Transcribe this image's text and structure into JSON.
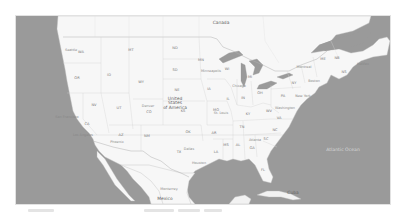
{
  "map": {
    "region": "North America",
    "style": "grayscale",
    "colors": {
      "water": "#9a9a9a",
      "land": "#f7f7f7",
      "border": "#bdbdbd",
      "state_border": "#cfcfcf",
      "frame_border": "#e2e2e2"
    },
    "countries": [
      {
        "id": "usa",
        "label": "United\nStates\nof America"
      },
      {
        "id": "canada",
        "label": "Canada"
      },
      {
        "id": "mexico",
        "label": "Mexico"
      },
      {
        "id": "cuba",
        "label": "Cuba"
      }
    ],
    "states": [
      {
        "abbr": "WA",
        "x": 80,
        "y": 52
      },
      {
        "abbr": "OR",
        "x": 76,
        "y": 78
      },
      {
        "abbr": "ID",
        "x": 108,
        "y": 75
      },
      {
        "abbr": "MT",
        "x": 130,
        "y": 50
      },
      {
        "abbr": "WY",
        "x": 140,
        "y": 82
      },
      {
        "abbr": "NV",
        "x": 93,
        "y": 105
      },
      {
        "abbr": "UT",
        "x": 118,
        "y": 108
      },
      {
        "abbr": "CA",
        "x": 86,
        "y": 124
      },
      {
        "abbr": "AZ",
        "x": 120,
        "y": 135
      },
      {
        "abbr": "CO",
        "x": 148,
        "y": 112
      },
      {
        "abbr": "NM",
        "x": 146,
        "y": 136
      },
      {
        "abbr": "ND",
        "x": 174,
        "y": 48
      },
      {
        "abbr": "SD",
        "x": 174,
        "y": 70
      },
      {
        "abbr": "NE",
        "x": 176,
        "y": 90
      },
      {
        "abbr": "KS",
        "x": 182,
        "y": 111
      },
      {
        "abbr": "OK",
        "x": 187,
        "y": 132
      },
      {
        "abbr": "TX",
        "x": 178,
        "y": 152
      },
      {
        "abbr": "MN",
        "x": 200,
        "y": 60
      },
      {
        "abbr": "IA",
        "x": 208,
        "y": 89
      },
      {
        "abbr": "MO",
        "x": 215,
        "y": 110
      },
      {
        "abbr": "AR",
        "x": 213,
        "y": 133
      },
      {
        "abbr": "LA",
        "x": 215,
        "y": 152
      },
      {
        "abbr": "WI",
        "x": 226,
        "y": 69
      },
      {
        "abbr": "IL",
        "x": 227,
        "y": 99
      },
      {
        "abbr": "MI",
        "x": 249,
        "y": 77
      },
      {
        "abbr": "IN",
        "x": 242,
        "y": 98
      },
      {
        "abbr": "OH",
        "x": 259,
        "y": 93
      },
      {
        "abbr": "KY",
        "x": 247,
        "y": 114
      },
      {
        "abbr": "TN",
        "x": 241,
        "y": 127
      },
      {
        "abbr": "MS",
        "x": 225,
        "y": 145
      },
      {
        "abbr": "AL",
        "x": 237,
        "y": 145
      },
      {
        "abbr": "GA",
        "x": 251,
        "y": 148
      },
      {
        "abbr": "FL",
        "x": 262,
        "y": 170
      },
      {
        "abbr": "SC",
        "x": 265,
        "y": 139
      },
      {
        "abbr": "NC",
        "x": 274,
        "y": 130
      },
      {
        "abbr": "VA",
        "x": 278,
        "y": 118
      },
      {
        "abbr": "WV",
        "x": 268,
        "y": 111
      },
      {
        "abbr": "PA",
        "x": 282,
        "y": 96
      },
      {
        "abbr": "NY",
        "x": 293,
        "y": 83
      },
      {
        "abbr": "ME",
        "x": 322,
        "y": 59
      },
      {
        "abbr": "NB",
        "x": 336,
        "y": 58
      },
      {
        "abbr": "NS",
        "x": 343,
        "y": 72
      }
    ],
    "cities": [
      {
        "name": "Seattle",
        "x": 70,
        "y": 50
      },
      {
        "name": "San Francisco",
        "x": 66,
        "y": 117
      },
      {
        "name": "Los Angeles",
        "x": 82,
        "y": 135
      },
      {
        "name": "Phoenix",
        "x": 116,
        "y": 142
      },
      {
        "name": "Denver",
        "x": 147,
        "y": 106
      },
      {
        "name": "Minneapolis",
        "x": 210,
        "y": 71
      },
      {
        "name": "Chicago",
        "x": 238,
        "y": 86
      },
      {
        "name": "St. Louis",
        "x": 220,
        "y": 113
      },
      {
        "name": "Atlanta",
        "x": 254,
        "y": 140
      },
      {
        "name": "Dallas",
        "x": 188,
        "y": 149
      },
      {
        "name": "Houston",
        "x": 198,
        "y": 163
      },
      {
        "name": "Monterrey",
        "x": 168,
        "y": 189
      },
      {
        "name": "Washington",
        "x": 284,
        "y": 108
      },
      {
        "name": "New York",
        "x": 302,
        "y": 96
      },
      {
        "name": "Boston",
        "x": 313,
        "y": 81
      },
      {
        "name": "Montreal",
        "x": 303,
        "y": 67
      },
      {
        "name": "Halifax",
        "x": 362,
        "y": 64
      }
    ],
    "ocean_labels": [
      {
        "name": "Atlantic Ocean",
        "x": 342,
        "y": 149
      }
    ]
  },
  "caption": {
    "segments": [
      {
        "x": 0,
        "w": 26
      },
      {
        "x": 116,
        "w": 30
      },
      {
        "x": 150,
        "w": 22
      },
      {
        "x": 176,
        "w": 18
      }
    ]
  }
}
